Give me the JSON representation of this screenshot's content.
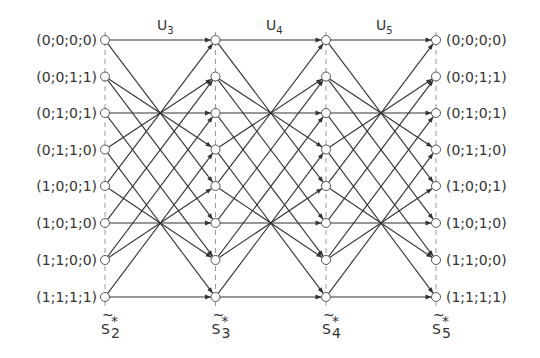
{
  "diagram": {
    "type": "trellis",
    "states": [
      "(0;0;0;0)",
      "(0;0;1;1)",
      "(0;1;0;1)",
      "(0;1;1;0)",
      "(1;0;0;1)",
      "(1;0;1;0)",
      "(1;1;0;0)",
      "(1;1;1;1)"
    ],
    "columns": [
      {
        "label": "S",
        "sub": "2",
        "accent": "~",
        "sup": "*"
      },
      {
        "label": "S",
        "sub": "3",
        "accent": "~",
        "sup": "*"
      },
      {
        "label": "S",
        "sub": "4",
        "accent": "~",
        "sup": "*"
      },
      {
        "label": "S",
        "sub": "5",
        "accent": "~",
        "sup": "*"
      }
    ],
    "stages": [
      {
        "label": "U",
        "sub": "3"
      },
      {
        "label": "U",
        "sub": "4"
      },
      {
        "label": "U",
        "sub": "5"
      }
    ],
    "transitions": [
      [
        0,
        0
      ],
      [
        0,
        4
      ],
      [
        1,
        3
      ],
      [
        1,
        5
      ],
      [
        2,
        2
      ],
      [
        2,
        6
      ],
      [
        3,
        1
      ],
      [
        3,
        7
      ],
      [
        4,
        0
      ],
      [
        4,
        6
      ],
      [
        5,
        5
      ],
      [
        5,
        1
      ],
      [
        6,
        4
      ],
      [
        6,
        2
      ],
      [
        7,
        7
      ],
      [
        7,
        3
      ]
    ],
    "colors": {
      "line": "#333333",
      "dash": "#999999",
      "node_fill": "#ffffff"
    }
  }
}
